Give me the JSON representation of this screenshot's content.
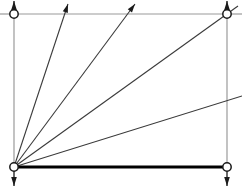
{
  "canvas": {
    "width": 242,
    "height": 195,
    "background": "#ffffff",
    "title": "angle-fan-diagram"
  },
  "colors": {
    "frame_stroke": "#9a9a9a",
    "ray_stroke": "#3a3a3a",
    "emphasis_stroke": "#000000",
    "node_fill": "#ffffff",
    "node_stroke": "#1a1a1a",
    "arrow_fill": "#1a1a1a"
  },
  "geometry": {
    "origin": {
      "x": 14,
      "y": 167,
      "label": "bottom-left-origin"
    },
    "frame": {
      "left": 14,
      "top": 14,
      "right": 227,
      "bottom": 167,
      "width": 213,
      "height": 153,
      "stroke_width": 1.2
    },
    "baseline": {
      "x1": 14,
      "y1": 167,
      "x2": 227,
      "y2": 167,
      "stroke_width": 3.2,
      "label": "thick-base-edge"
    },
    "left_stub": {
      "x1": 0,
      "y1": 14,
      "x2": 14,
      "y2": 14
    },
    "right_stub": {
      "x1": 227,
      "y1": 14,
      "x2": 242,
      "y2": 14
    }
  },
  "nodes": [
    {
      "id": "node-top-left",
      "x": 14,
      "y": 14,
      "r": 4.2
    },
    {
      "id": "node-top-right",
      "x": 227,
      "y": 14,
      "r": 4.2
    },
    {
      "id": "node-bottom-left",
      "x": 14,
      "y": 167,
      "r": 4.2
    },
    {
      "id": "node-bottom-right",
      "x": 227,
      "y": 167,
      "r": 4.2
    }
  ],
  "corner_arrows": [
    {
      "id": "arrow-top-left-up",
      "x": 14,
      "y_tip": 1,
      "y_tail": 14,
      "direction": "up"
    },
    {
      "id": "arrow-top-right-up",
      "x": 227,
      "y_tip": 1,
      "y_tail": 14,
      "direction": "up"
    },
    {
      "id": "arrow-bottom-left-down",
      "x": 14,
      "y_tip": 186,
      "y_tail": 167,
      "direction": "down"
    },
    {
      "id": "arrow-bottom-right-down",
      "x": 227,
      "y_tip": 186,
      "y_tail": 167,
      "direction": "down"
    }
  ],
  "rays": [
    {
      "id": "ray-1",
      "x1": 14,
      "y1": 167,
      "x2": 68,
      "y2": 4,
      "arrowhead": true,
      "stroke_width": 1.1,
      "crosses_top_edge": true
    },
    {
      "id": "ray-2",
      "x1": 14,
      "y1": 167,
      "x2": 135,
      "y2": 4,
      "arrowhead": true,
      "stroke_width": 1.1,
      "crosses_top_edge": true
    },
    {
      "id": "ray-3",
      "x1": 14,
      "y1": 167,
      "x2": 238,
      "y2": 6,
      "arrowhead": false,
      "stroke_width": 1.1,
      "crosses_top_edge": false
    },
    {
      "id": "ray-4",
      "x1": 14,
      "y1": 167,
      "x2": 242,
      "y2": 96,
      "arrowhead": false,
      "stroke_width": 1.1,
      "crosses_top_edge": false
    }
  ],
  "ray_count": 4,
  "node_count": 4
}
